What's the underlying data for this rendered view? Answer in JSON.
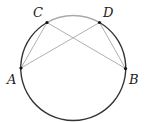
{
  "diagram": {
    "type": "circle-inscribed-chords",
    "circle": {
      "cx": 73.5,
      "cy": 68,
      "r": 52.5
    },
    "colors": {
      "circle": "#333333",
      "arc_cd": "#aaaaaa",
      "chords": "#b0b0b0",
      "points": "#111111",
      "labels": "#222222"
    },
    "points": [
      {
        "name": "A",
        "x": 21,
        "y": 68,
        "label_x": 7,
        "label_y": 84
      },
      {
        "name": "B",
        "x": 125.5,
        "y": 68.5,
        "label_x": 129,
        "label_y": 84
      },
      {
        "name": "C",
        "x": 47,
        "y": 22.5,
        "label_x": 33,
        "label_y": 17
      },
      {
        "name": "D",
        "x": 99.5,
        "y": 22.5,
        "label_x": 103,
        "label_y": 17
      }
    ],
    "segments": [
      {
        "from": "A",
        "to": "C"
      },
      {
        "from": "A",
        "to": "D"
      },
      {
        "from": "C",
        "to": "B"
      },
      {
        "from": "D",
        "to": "B"
      }
    ],
    "labels": {
      "A": "A",
      "B": "B",
      "C": "C",
      "D": "D"
    }
  }
}
